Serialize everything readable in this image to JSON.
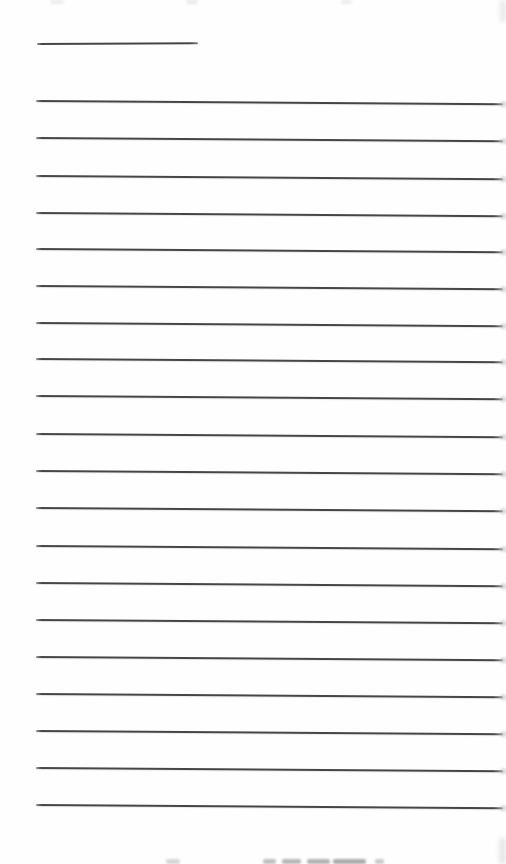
{
  "page": {
    "width": 506,
    "height": 864,
    "background": "#fefefe"
  },
  "ruling": {
    "color": "#464646",
    "thickness": 2,
    "left_x": 36,
    "right_x": 503,
    "slope_deg": 0.4,
    "line_ys": [
      100,
      137,
      175,
      212,
      248,
      285,
      322,
      358,
      395,
      433,
      470,
      507,
      545,
      582,
      619,
      656,
      693,
      730,
      767,
      804
    ]
  },
  "header_underline": {
    "x": 37,
    "y": 43,
    "width": 161,
    "slope_deg": -0.3,
    "color": "#464646"
  },
  "artifacts": {
    "top_smudges": [
      {
        "x": 50,
        "y": 0,
        "w": 14,
        "h": 4,
        "color": "#e8e8e8",
        "blur": 1.5,
        "opacity": 0.8
      },
      {
        "x": 186,
        "y": 0,
        "w": 12,
        "h": 4,
        "color": "#e4e4e4",
        "blur": 1.5,
        "opacity": 0.8
      },
      {
        "x": 341,
        "y": 0,
        "w": 11,
        "h": 4,
        "color": "#e8e8e8",
        "blur": 1.5,
        "opacity": 0.8
      },
      {
        "x": 500,
        "y": 0,
        "w": 6,
        "h": 22,
        "color": "#e0e0e0",
        "blur": 2,
        "opacity": 0.7
      }
    ],
    "bottom_smudges": [
      {
        "x": 166,
        "y": 859,
        "w": 14,
        "h": 5,
        "color": "#d2d2d2",
        "blur": 1.2,
        "opacity": 0.9
      },
      {
        "x": 263,
        "y": 859,
        "w": 13,
        "h": 5,
        "color": "#bdbdbd",
        "blur": 1,
        "opacity": 0.95
      },
      {
        "x": 282,
        "y": 859,
        "w": 19,
        "h": 5,
        "color": "#b4b4b4",
        "blur": 1,
        "opacity": 0.95
      },
      {
        "x": 307,
        "y": 859,
        "w": 23,
        "h": 5,
        "color": "#b0b0b0",
        "blur": 1,
        "opacity": 0.95
      },
      {
        "x": 333,
        "y": 859,
        "w": 33,
        "h": 5,
        "color": "#a8a8a8",
        "blur": 1,
        "opacity": 0.95
      },
      {
        "x": 375,
        "y": 859,
        "w": 9,
        "h": 5,
        "color": "#c4c4c4",
        "blur": 1,
        "opacity": 0.9
      },
      {
        "x": 499,
        "y": 838,
        "w": 7,
        "h": 26,
        "color": "#dedede",
        "blur": 2,
        "opacity": 0.7
      }
    ]
  }
}
